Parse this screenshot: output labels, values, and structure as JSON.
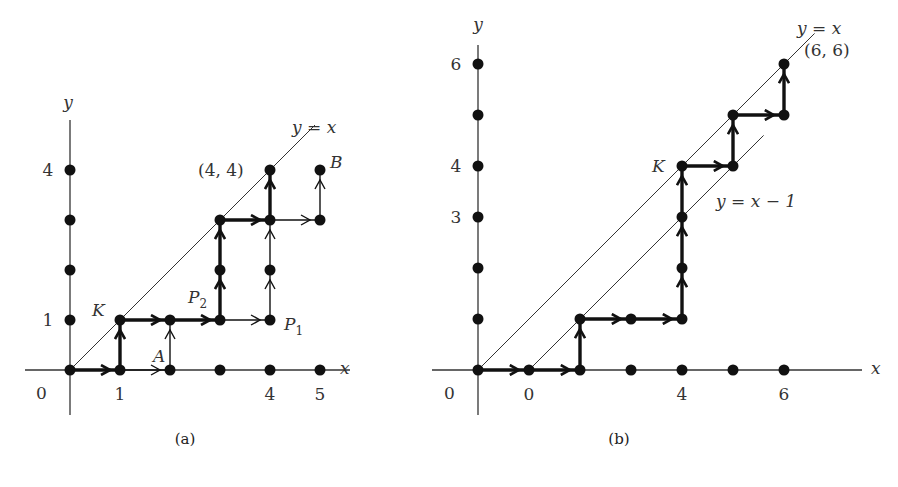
{
  "figures": [
    {
      "id": "a",
      "caption": "(a)",
      "axis_x_label": "x",
      "axis_y_label": "y",
      "origin_label": "0",
      "x_tick_labels": [
        {
          "v": 1,
          "t": "1"
        },
        {
          "v": 4,
          "t": "4"
        },
        {
          "v": 5,
          "t": "5"
        }
      ],
      "y_tick_labels": [
        {
          "v": 1,
          "t": "1"
        },
        {
          "v": 4,
          "t": "4"
        }
      ],
      "x_dots": [
        0,
        1,
        2,
        3,
        4,
        5
      ],
      "y_dots": [
        1,
        2,
        3,
        4
      ],
      "diagonal_lines": [
        {
          "label": "y = x",
          "offset": 0,
          "from": 0,
          "to": 4.9
        }
      ],
      "bold_path": [
        [
          0,
          0
        ],
        [
          1,
          0
        ],
        [
          1,
          1
        ],
        [
          2,
          1
        ],
        [
          3,
          1
        ],
        [
          3,
          2
        ],
        [
          3,
          3
        ],
        [
          4,
          3
        ],
        [
          4,
          4
        ]
      ],
      "thin_segments": [
        [
          [
            1,
            0
          ],
          [
            2,
            0
          ]
        ],
        [
          [
            2,
            0
          ],
          [
            2,
            1
          ]
        ],
        [
          [
            3,
            1
          ],
          [
            4,
            1
          ]
        ],
        [
          [
            4,
            1
          ],
          [
            4,
            2
          ]
        ],
        [
          [
            4,
            2
          ],
          [
            4,
            3
          ]
        ],
        [
          [
            4,
            3
          ],
          [
            5,
            3
          ]
        ],
        [
          [
            5,
            3
          ],
          [
            5,
            4
          ]
        ]
      ],
      "extra_points": [
        [
          2,
          1
        ],
        [
          3,
          2
        ],
        [
          4,
          2
        ],
        [
          5,
          3
        ],
        [
          5,
          4
        ],
        [
          4,
          1
        ]
      ],
      "point_labels": [
        {
          "text": "K",
          "at": [
            1,
            1
          ],
          "italic": true
        },
        {
          "text": "A",
          "at": [
            1.5,
            0
          ],
          "italic": true
        },
        {
          "text": "P",
          "sub": "2",
          "at": [
            3,
            1.5
          ],
          "italic": true
        },
        {
          "text": "P",
          "sub": "1",
          "at": [
            4,
            1
          ],
          "italic": true
        },
        {
          "text": "B",
          "at": [
            5,
            4
          ],
          "italic": true
        },
        {
          "text": "(4, 4)",
          "at": [
            4,
            4
          ],
          "italic": false
        }
      ]
    },
    {
      "id": "b",
      "caption": "(b)",
      "axis_x_label": "x",
      "axis_y_label": "y",
      "origin_label": "0",
      "x_tick_labels": [
        {
          "v": 1,
          "t": "0"
        },
        {
          "v": 4,
          "t": "4"
        },
        {
          "v": 6,
          "t": "6"
        }
      ],
      "y_tick_labels": [
        {
          "v": 3,
          "t": "3"
        },
        {
          "v": 4,
          "t": "4"
        },
        {
          "v": 6,
          "t": "6"
        }
      ],
      "x_dots": [
        0,
        1,
        2,
        3,
        4,
        5,
        6
      ],
      "y_dots": [
        1,
        2,
        3,
        4,
        5,
        6
      ],
      "diagonal_lines": [
        {
          "label": "y = x",
          "offset": 0,
          "from": 0,
          "to": 6.6
        },
        {
          "label": "y = x − 1",
          "offset": 1,
          "from": 1,
          "to": 5.6
        }
      ],
      "bold_path": [
        [
          0,
          0
        ],
        [
          1,
          0
        ],
        [
          2,
          0
        ],
        [
          2,
          1
        ],
        [
          3,
          1
        ],
        [
          4,
          1
        ],
        [
          4,
          2
        ],
        [
          4,
          3
        ],
        [
          4,
          4
        ],
        [
          5,
          4
        ],
        [
          5,
          5
        ],
        [
          6,
          5
        ],
        [
          6,
          6
        ]
      ],
      "thin_segments": [],
      "extra_points": [
        [
          2,
          1
        ],
        [
          3,
          1
        ],
        [
          4,
          1
        ],
        [
          4,
          2
        ],
        [
          4,
          3
        ],
        [
          4,
          4
        ],
        [
          5,
          4
        ],
        [
          5,
          5
        ],
        [
          6,
          5
        ]
      ],
      "point_labels": [
        {
          "text": "K",
          "at": [
            4,
            4
          ],
          "italic": true
        },
        {
          "text": "(6, 6)",
          "at": [
            6,
            6
          ],
          "italic": false
        }
      ]
    }
  ]
}
